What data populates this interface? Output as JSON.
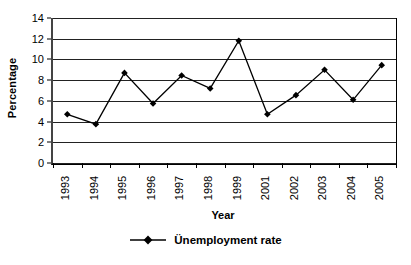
{
  "chart_data": {
    "type": "line",
    "title": "",
    "xlabel": "Year",
    "ylabel": "Percentage",
    "categories": [
      "1993",
      "1994",
      "1995",
      "1996",
      "1997",
      "1998",
      "1999",
      "2001",
      "2002",
      "2003",
      "2004",
      "2005"
    ],
    "series": [
      {
        "name": "Ünemployment rate",
        "values": [
          4.7,
          3.75,
          8.7,
          5.75,
          8.45,
          7.2,
          11.8,
          4.7,
          6.55,
          9.0,
          6.1,
          9.45
        ]
      }
    ],
    "ylim": [
      0,
      14
    ],
    "yticks": [
      0,
      2,
      4,
      6,
      8,
      10,
      12,
      14
    ],
    "ytick_labels": [
      "0",
      "2",
      "4",
      "6",
      "8",
      "10",
      "12",
      "14"
    ],
    "grid": true,
    "grid_axis": "y",
    "legend_position": "bottom",
    "marker": "diamond",
    "series_color": "#000000"
  },
  "legend": {
    "marker_name": "line-with-diamond-marker",
    "label": "Ünemployment rate"
  },
  "axes": {
    "x_title": "Year",
    "y_title": "Percentage"
  }
}
